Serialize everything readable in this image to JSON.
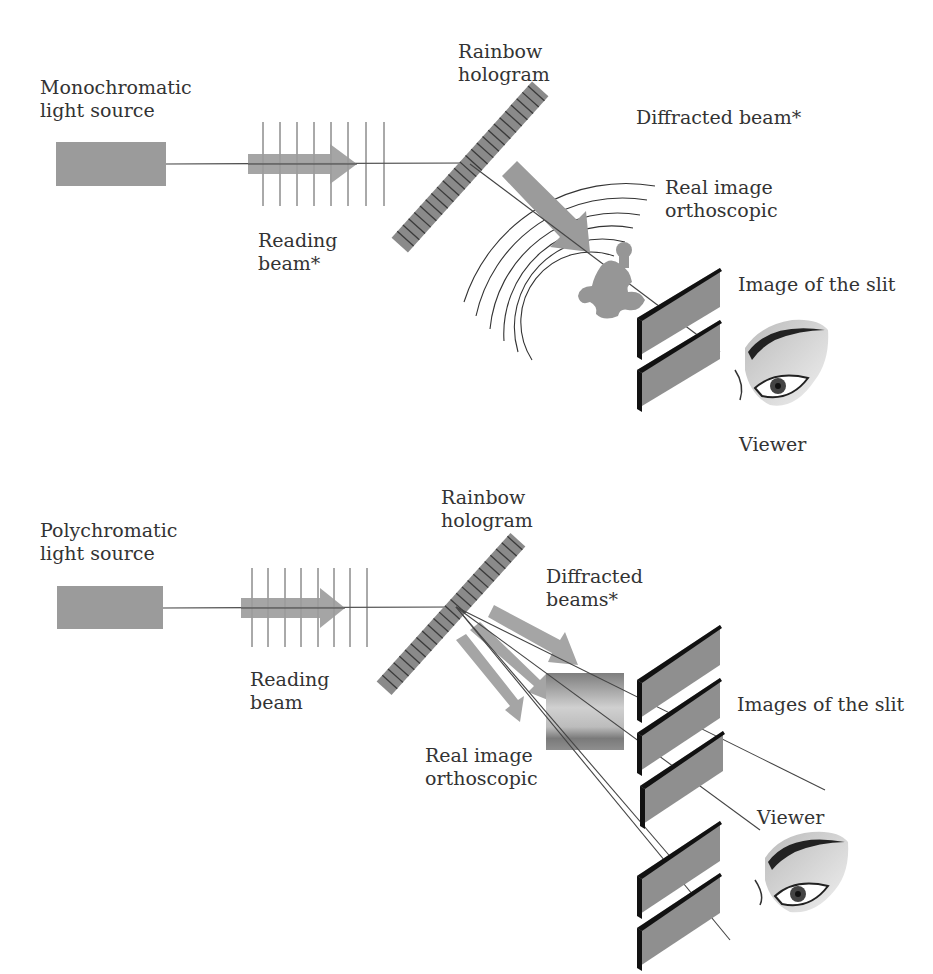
{
  "colors": {
    "component_gray": "#9b9b9b",
    "hologram_fill": "#8a8a8a",
    "hologram_lines": "#3a3a3a",
    "slit_face": "#8f8f8f",
    "slit_edge": "#111111",
    "ray": "#444444",
    "text": "#333333"
  },
  "panels": [
    {
      "id": "monochromatic",
      "source_label": [
        "Monochromatic",
        "light source"
      ],
      "reading_beam_label": [
        "Reading",
        "beam*"
      ],
      "hologram_label": [
        "Rainbow",
        "hologram"
      ],
      "diffracted_label": [
        "Diffracted beam*"
      ],
      "real_image_label": [
        "Real image",
        "orthoscopic"
      ],
      "slit_label": [
        "Image of the slit"
      ],
      "viewer_label": [
        "Viewer"
      ]
    },
    {
      "id": "polychromatic",
      "source_label": [
        "Polychromatic",
        "light source"
      ],
      "reading_beam_label": [
        "Reading",
        "beam"
      ],
      "hologram_label": [
        "Rainbow",
        "hologram"
      ],
      "diffracted_label": [
        "Diffracted",
        "beams*"
      ],
      "real_image_label": [
        "Real image",
        "orthoscopic"
      ],
      "slit_label": [
        "Images of the slit"
      ],
      "viewer_label": [
        "Viewer"
      ]
    }
  ]
}
